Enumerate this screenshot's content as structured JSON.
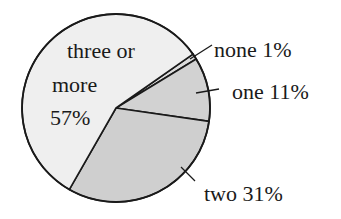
{
  "chart_data": {
    "type": "pie",
    "title": "",
    "categories": [
      "none",
      "one",
      "two",
      "three or more"
    ],
    "values": [
      1,
      11,
      31,
      57
    ],
    "unit": "%",
    "labels": [
      "none 1%",
      "one 11%",
      "two 31%",
      "three or more 57%"
    ],
    "colors": [
      "#dcdcdc",
      "#d2d2d2",
      "#cfcfcf",
      "#efefef"
    ],
    "legend": "none (inline labels)"
  },
  "labels": {
    "none": "none 1%",
    "one": "one 11%",
    "two": "two 31%",
    "three_line1": "three or",
    "three_line2": "more",
    "three_line3": "57%"
  }
}
